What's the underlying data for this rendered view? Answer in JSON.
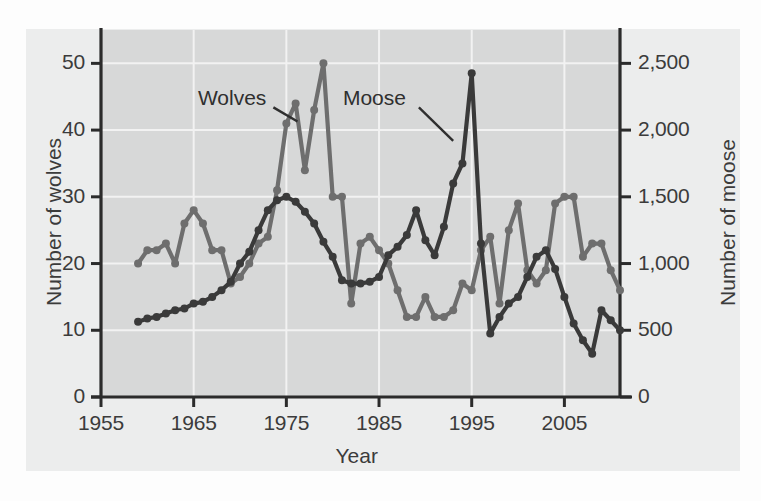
{
  "chart_data": {
    "type": "line",
    "title": "",
    "subtitle": "",
    "xlabel": "Year",
    "ylabel": "Number of wolves",
    "ylabel_right": "Number of moose",
    "xlim": [
      1955,
      2011
    ],
    "ylim": [
      0,
      55
    ],
    "ylim_right": [
      0,
      2750
    ],
    "xticks": [
      1955,
      1965,
      1975,
      1985,
      1995,
      2005
    ],
    "xticklabels": [
      "1955",
      "1965",
      "1975",
      "1985",
      "1995",
      "2005"
    ],
    "yticks": [
      0,
      10,
      20,
      30,
      40,
      50
    ],
    "yticklabels": [
      "0",
      "10",
      "20",
      "30",
      "40",
      "50"
    ],
    "yticks_right": [
      0,
      500,
      1000,
      1500,
      2000,
      2500
    ],
    "yticklabels_right": [
      "0",
      "500",
      "1,000",
      "1,500",
      "2,000",
      "2,500"
    ],
    "grid": true,
    "grid_color": "#f2f2f2",
    "panel_color": "#d7d8d8",
    "card_color": "#eceded",
    "legend_position": "inline-annotation",
    "annotations": [
      {
        "text": "Wolves",
        "x": 1971.5,
        "y": 44.5,
        "points_to_x": 1976.5,
        "points_to_y": 41.0
      },
      {
        "text": "Moose",
        "x": 1986.5,
        "y": 44.5,
        "points_to_x": 1993.0,
        "points_to_y": 37.0
      }
    ],
    "series": [
      {
        "name": "Wolves",
        "axis": "left",
        "color": "#6e6e6e",
        "marker": "circle",
        "x": [
          1959,
          1960,
          1961,
          1962,
          1963,
          1964,
          1965,
          1966,
          1967,
          1968,
          1969,
          1970,
          1971,
          1972,
          1973,
          1974,
          1975,
          1976,
          1977,
          1978,
          1979,
          1980,
          1981,
          1982,
          1983,
          1984,
          1985,
          1986,
          1987,
          1988,
          1989,
          1990,
          1991,
          1992,
          1993,
          1994,
          1995,
          1996,
          1997,
          1998,
          1999,
          2000,
          2001,
          2002,
          2003,
          2004,
          2005,
          2006,
          2007,
          2008,
          2009,
          2010,
          2011
        ],
        "values": [
          20,
          22,
          22,
          23,
          20,
          26,
          28,
          26,
          22,
          22,
          17,
          18,
          20,
          23,
          24,
          31,
          41,
          44,
          34,
          43,
          50,
          30,
          30,
          14,
          23,
          24,
          22,
          20,
          16,
          12,
          12,
          15,
          12,
          12,
          13,
          17,
          16,
          22,
          24,
          14,
          25,
          29,
          19,
          17,
          19,
          29,
          30,
          30,
          21,
          23,
          23,
          19,
          16
        ]
      },
      {
        "name": "Moose",
        "axis": "right",
        "color": "#3a3a3a",
        "marker": "circle",
        "x": [
          1959,
          1960,
          1961,
          1962,
          1963,
          1964,
          1965,
          1966,
          1967,
          1968,
          1969,
          1970,
          1971,
          1972,
          1973,
          1974,
          1975,
          1976,
          1977,
          1978,
          1979,
          1980,
          1981,
          1982,
          1983,
          1984,
          1985,
          1986,
          1987,
          1988,
          1989,
          1990,
          1991,
          1992,
          1993,
          1994,
          1995,
          1996,
          1997,
          1998,
          1999,
          2000,
          2001,
          2002,
          2003,
          2004,
          2005,
          2006,
          2007,
          2008,
          2009,
          2010,
          2011
        ],
        "values": [
          563,
          588,
          600,
          625,
          650,
          663,
          700,
          713,
          750,
          800,
          863,
          1000,
          1088,
          1250,
          1400,
          1475,
          1500,
          1463,
          1388,
          1300,
          1163,
          1050,
          875,
          850,
          850,
          863,
          900,
          1063,
          1125,
          1213,
          1400,
          1175,
          1063,
          1275,
          1600,
          1750,
          2425,
          1150,
          475,
          600,
          700,
          750,
          900,
          1050,
          1100,
          960,
          750,
          550,
          425,
          325,
          650,
          575,
          500
        ]
      }
    ]
  }
}
